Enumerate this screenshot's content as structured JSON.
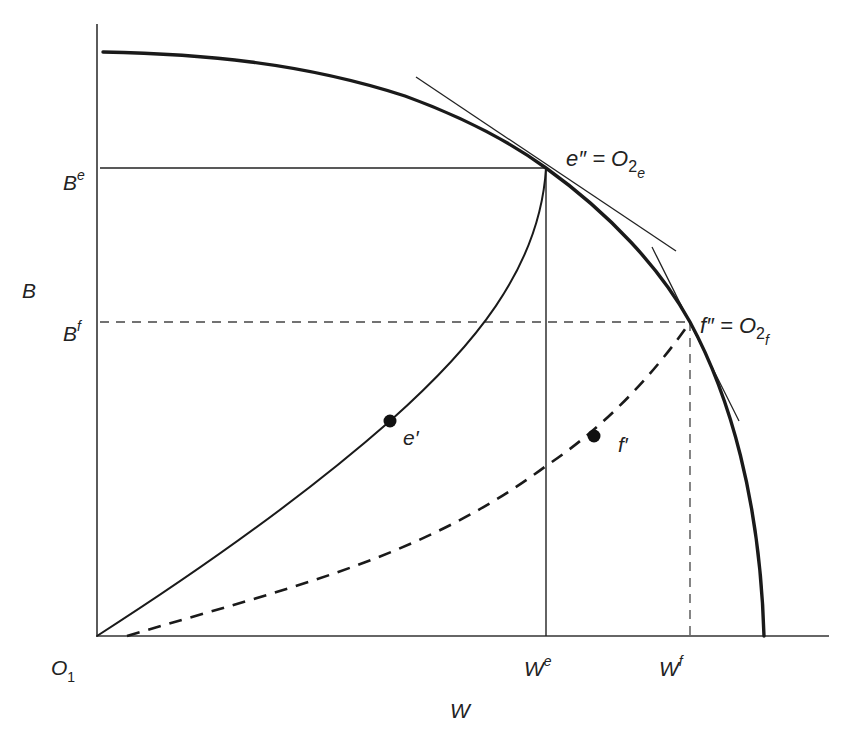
{
  "diagram": {
    "type": "edgeworth-box-utility-frontier",
    "axes": {
      "x_label": "W",
      "y_label": "B",
      "origin_label": "O",
      "origin_subscript": "1"
    },
    "y_ticks": [
      {
        "base": "B",
        "sup": "e"
      },
      {
        "base": "B",
        "sup": "f"
      }
    ],
    "x_ticks": [
      {
        "base": "W",
        "sup": "e"
      },
      {
        "base": "W",
        "sup": "f"
      }
    ],
    "points": {
      "e_double_prime": {
        "lhs": "e″ = O",
        "sub": "2",
        "subsub": "e"
      },
      "f_double_prime": {
        "lhs": "f″ = O",
        "sub": "2",
        "subsub": "f"
      },
      "e_prime": {
        "label": "e′"
      },
      "f_prime": {
        "label": "f′"
      }
    },
    "curves": [
      {
        "name": "production-possibility-frontier",
        "style": "thick solid"
      },
      {
        "name": "contract-curve-e",
        "style": "solid",
        "from": "O1",
        "to": "e″"
      },
      {
        "name": "contract-curve-f",
        "style": "dashed",
        "from": "O1",
        "to": "f″"
      },
      {
        "name": "tangent-at-e",
        "style": "thin solid"
      },
      {
        "name": "tangent-at-f",
        "style": "thin solid"
      }
    ],
    "colors": {
      "ink": "#1a1a1a",
      "background": "#ffffff"
    }
  }
}
